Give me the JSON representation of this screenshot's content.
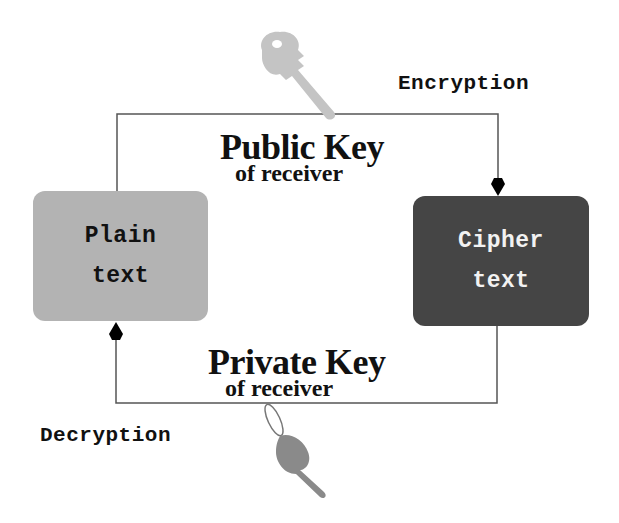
{
  "diagram": {
    "nodes": {
      "plain": {
        "line1": "Plain",
        "line2": "text",
        "fill": "#b3b3b3",
        "text_color": "#111111"
      },
      "cipher": {
        "line1": "Cipher",
        "line2": "text",
        "fill": "#454545",
        "text_color": "#f2f2f2"
      }
    },
    "edges": {
      "encryption": {
        "label": "Encryption",
        "key_title": "Public Key",
        "key_subtitle": "of receiver",
        "from": "plain",
        "to": "cipher",
        "key_icon": "light-gray-key"
      },
      "decryption": {
        "label": "Decryption",
        "key_title": "Private Key",
        "key_subtitle": "of receiver",
        "from": "cipher",
        "to": "plain",
        "key_icon": "dark-gray-key-with-ring"
      }
    },
    "colors": {
      "line": "#555555",
      "arrow": "#000000",
      "public_key": "#c4c4c4",
      "private_key": "#8a8a8a"
    }
  }
}
